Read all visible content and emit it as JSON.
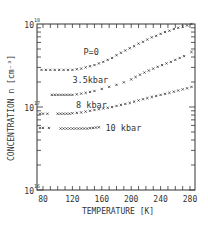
{
  "chart_data": {
    "type": "scatter",
    "title": "",
    "xlabel": "TEMPERATURE  [K]",
    "ylabel": "CONCENTRATION  n  [cm⁻³]",
    "xlim": [
      72,
      293
    ],
    "ylim": [
      1e+16,
      1e+18
    ],
    "yscale": "log",
    "grid": false,
    "legend": "inline labels",
    "x_ticks": [
      80,
      120,
      160,
      200,
      240,
      280
    ],
    "y_ticks": [
      "10^16",
      "10^17",
      "10^18"
    ],
    "series": [
      {
        "name": "P=0",
        "marker": "x",
        "x": [
          78,
          84,
          90,
          96,
          102,
          108,
          114,
          120,
          126,
          132,
          138,
          144,
          150,
          156,
          162,
          168,
          174,
          180,
          186,
          192,
          198,
          204,
          210,
          216,
          222,
          228,
          234,
          240,
          246,
          252,
          258,
          264,
          270,
          276,
          282
        ],
        "values": [
          2.8e+17,
          2.8e+17,
          2.8e+17,
          2.8e+17,
          2.8e+17,
          2.8e+17,
          2.8e+17,
          2.8e+17,
          2.85e+17,
          2.9e+17,
          3e+17,
          3.1e+17,
          3.2e+17,
          3.35e+17,
          3.5e+17,
          3.7e+17,
          3.9e+17,
          4.2e+17,
          4.5e+17,
          4.8e+17,
          5.1e+17,
          5.4e+17,
          5.8e+17,
          6.1e+17,
          6.5e+17,
          6.9e+17,
          7.2e+17,
          7.6e+17,
          8e+17,
          8.3e+17,
          8.7e+17,
          9e+17,
          9.3e+17,
          9.6e+17,
          1e+18
        ]
      },
      {
        "name": "3.5kbar",
        "marker": "x",
        "x": [
          92,
          96,
          100,
          104,
          108,
          112,
          116,
          120,
          126,
          132,
          138,
          144,
          150,
          160,
          170,
          180,
          190,
          200,
          206,
          212,
          218,
          224,
          230,
          236,
          242,
          248,
          254,
          260,
          266,
          272,
          282
        ],
        "values": [
          1.4e+17,
          1.4e+17,
          1.4e+17,
          1.4e+17,
          1.4e+17,
          1.4e+17,
          1.4e+17,
          1.4e+17,
          1.42e+17,
          1.45e+17,
          1.48e+17,
          1.52e+17,
          1.56e+17,
          1.65e+17,
          1.75e+17,
          1.85e+17,
          1.98e+17,
          2.15e+17,
          2.3e+17,
          2.45e+17,
          2.6e+17,
          2.75e+17,
          2.9e+17,
          3.05e+17,
          3.2e+17,
          3.35e+17,
          3.5e+17,
          3.7e+17,
          3.9e+17,
          4.1e+17,
          4.6e+17
        ]
      },
      {
        "name": "8 kbar",
        "marker": "x",
        "x": [
          76,
          80,
          86,
          100,
          104,
          108,
          112,
          116,
          120,
          126,
          132,
          138,
          144,
          150,
          156,
          162,
          168,
          174,
          180,
          186,
          192,
          198,
          204,
          210,
          216,
          222,
          228,
          234,
          240,
          246,
          252,
          258,
          264,
          270,
          276,
          282
        ],
        "values": [
          8.3e+16,
          8.3e+16,
          8.3e+16,
          8.3e+16,
          8.3e+16,
          8.3e+16,
          8.3e+16,
          8.3e+16,
          8.4e+16,
          8.5e+16,
          8.6e+16,
          8.8e+16,
          9e+16,
          9.2e+16,
          9.4e+16,
          9.6e+16,
          9.8e+16,
          1e+17,
          1.03e+17,
          1.06e+17,
          1.09e+17,
          1.12e+17,
          1.16e+17,
          1.2e+17,
          1.24e+17,
          1.28e+17,
          1.32e+17,
          1.36e+17,
          1.4e+17,
          1.44e+17,
          1.48e+17,
          1.53e+17,
          1.58e+17,
          1.63e+17,
          1.68e+17,
          1.75e+17
        ]
      },
      {
        "name": "10 kbar",
        "marker": "x",
        "x": [
          76,
          80,
          88,
          104,
          108,
          112,
          116,
          120,
          124,
          128,
          132,
          136,
          140,
          144,
          148,
          152,
          156
        ],
        "values": [
          5.6e+16,
          5.6e+16,
          5.6e+16,
          5.5e+16,
          5.5e+16,
          5.5e+16,
          5.5e+16,
          5.5e+16,
          5.5e+16,
          5.5e+16,
          5.5e+16,
          5.5e+16,
          5.5e+16,
          5.55e+16,
          5.6e+16,
          5.65e+16,
          5.7e+16
        ]
      }
    ],
    "annotations": [
      {
        "text": "P=0",
        "x": 135,
        "y": 4.6e+17
      },
      {
        "text": "3.5kbar",
        "x": 120,
        "y": 2.1e+17
      },
      {
        "text": "8 kbar",
        "x": 125,
        "y": 1.05e+17
      },
      {
        "text": "10 kbar",
        "x": 165,
        "y": 5.6e+16
      }
    ]
  },
  "axes": {
    "x_tick_labels": [
      "80",
      "120",
      "160",
      "200",
      "240",
      "280"
    ],
    "y_tick_labels": [
      {
        "base": "10",
        "exp": "18"
      },
      {
        "base": "10",
        "exp": "17"
      },
      {
        "base": "10",
        "exp": "16"
      }
    ],
    "xlabel": "TEMPERATURE  [K]",
    "ylabel": "CONCENTRATION  n  [cm⁻³]"
  }
}
